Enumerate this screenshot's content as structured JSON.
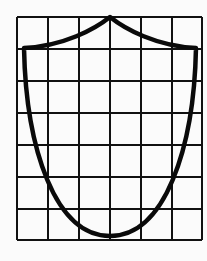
{
  "diagram": {
    "type": "shield-on-grid",
    "grid": {
      "columns": 6,
      "rows": 7,
      "x_lines": [
        17,
        48,
        79,
        110,
        141,
        172,
        202
      ],
      "y_lines": [
        17,
        49,
        81,
        113,
        145,
        177,
        209,
        240
      ],
      "line_color": "#111111"
    },
    "shield": {
      "stroke_color": "#0a0a0a",
      "apex": [
        110,
        17
      ],
      "left_shoulder": [
        24,
        48
      ],
      "right_shoulder": [
        196,
        48
      ],
      "bottom_point": [
        110,
        236
      ]
    },
    "background_color": "#fbfbfb"
  }
}
